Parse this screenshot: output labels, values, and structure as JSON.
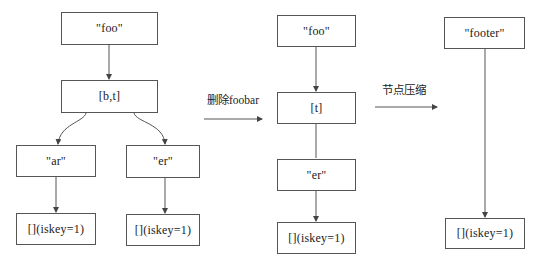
{
  "diagram": {
    "stages": [
      {
        "id": "original",
        "nodes": [
          {
            "id": "foo1",
            "label": "\"foo\"",
            "x": 61,
            "y": 12,
            "w": 97,
            "h": 33
          },
          {
            "id": "bt",
            "label": "[b,t]",
            "x": 61,
            "y": 80,
            "w": 97,
            "h": 33
          },
          {
            "id": "ar",
            "label": "\"ar\"",
            "x": 16,
            "y": 145,
            "w": 80,
            "h": 32
          },
          {
            "id": "er1",
            "label": "\"er\"",
            "x": 126,
            "y": 145,
            "w": 74,
            "h": 33
          },
          {
            "id": "leaf1",
            "label": "[](iskey=1)",
            "x": 16,
            "y": 213,
            "w": 80,
            "h": 32
          },
          {
            "id": "leaf2",
            "label": "[](iskey=1)",
            "x": 126,
            "y": 214,
            "w": 74,
            "h": 32
          }
        ]
      },
      {
        "id": "after-delete",
        "nodes": [
          {
            "id": "foo2",
            "label": "\"foo\"",
            "x": 277,
            "y": 15,
            "w": 79,
            "h": 32
          },
          {
            "id": "t",
            "label": "[t]",
            "x": 277,
            "y": 92,
            "w": 79,
            "h": 32
          },
          {
            "id": "er2",
            "label": "\"er\"",
            "x": 277,
            "y": 159,
            "w": 79,
            "h": 32
          },
          {
            "id": "leaf3",
            "label": "[](iskey=1)",
            "x": 277,
            "y": 222,
            "w": 79,
            "h": 32
          }
        ]
      },
      {
        "id": "after-compress",
        "nodes": [
          {
            "id": "footer",
            "label": "\"footer\"",
            "x": 444,
            "y": 17,
            "w": 81,
            "h": 32
          },
          {
            "id": "leaf4",
            "label": "[](iskey=1)",
            "x": 445,
            "y": 218,
            "w": 80,
            "h": 31
          }
        ]
      }
    ],
    "transitions": [
      {
        "id": "delete",
        "label": "删除foobar",
        "x1": 204,
        "x2": 262,
        "y": 119,
        "label_x": 207,
        "label_y": 91
      },
      {
        "id": "compress",
        "label": "节点压缩",
        "x1": 375,
        "x2": 437,
        "y": 107,
        "label_x": 382,
        "label_y": 81
      }
    ],
    "colors": {
      "stroke": "#555555",
      "text": "#222222",
      "background": "#ffffff"
    }
  }
}
